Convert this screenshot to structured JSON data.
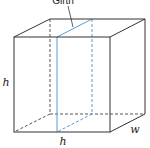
{
  "diagram": {
    "title": "Girth",
    "labels": {
      "height": "h",
      "length": "h",
      "width": "w"
    },
    "colors": {
      "edge": "#333333",
      "hidden_edge": "#444444",
      "girth": "#5b9bd5",
      "background": "#ffffff"
    }
  }
}
